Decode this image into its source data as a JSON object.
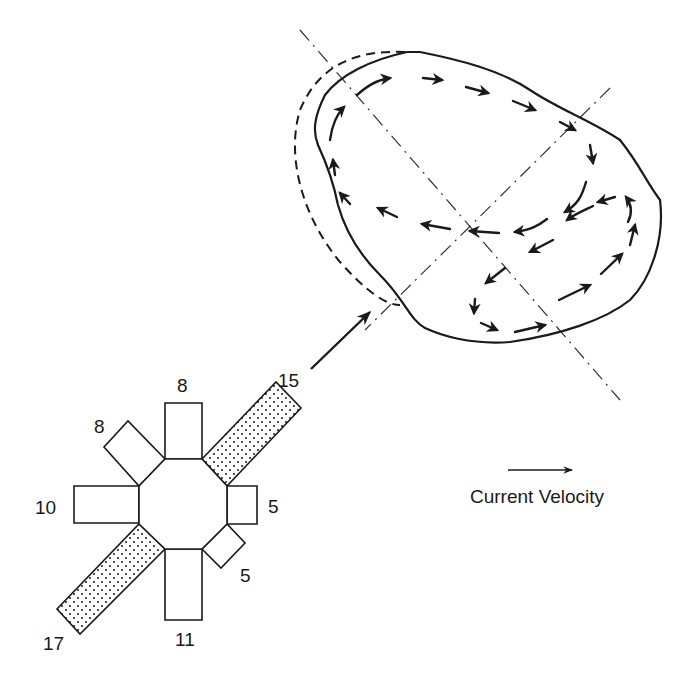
{
  "diagram": {
    "type": "eddy-current-diagram",
    "rose_labels": {
      "n": "8",
      "nw": "8",
      "w": "10",
      "sw": "17",
      "s": "11",
      "se": "5",
      "e": "5",
      "ne": "15"
    },
    "dominant_directions": [
      "ne",
      "sw"
    ],
    "legend": {
      "label": "Current Velocity",
      "icon": "arrow-right-icon"
    },
    "eddy": {
      "description": "Closed eddy outline with circulating current vectors and dashed alternative boundary",
      "axes": 2
    }
  }
}
